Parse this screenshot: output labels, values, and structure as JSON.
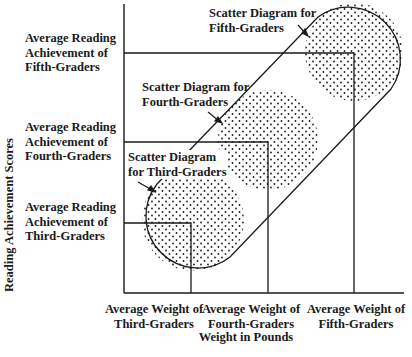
{
  "diagram": {
    "y_axis_title": "Reading Achievement Scores",
    "x_axis_title": "Weight in Pounds",
    "y_labels": [
      {
        "lines": [
          "Average Reading",
          "Achievement of",
          "Fifth-Graders"
        ]
      },
      {
        "lines": [
          "Average Reading",
          "Achievement of",
          "Fourth-Graders"
        ]
      },
      {
        "lines": [
          "Average Reading",
          "Achievement of",
          "Third-Graders"
        ]
      }
    ],
    "x_labels": [
      {
        "lines": [
          "Average Weight of",
          "Third-Graders"
        ]
      },
      {
        "lines": [
          "Average Weight of",
          "Fourth-Graders"
        ]
      },
      {
        "lines": [
          "Average Weight of",
          "Fifth-Graders"
        ]
      }
    ],
    "scatter_labels": [
      {
        "lines": [
          "Scatter Diagram",
          "for Third-Graders"
        ]
      },
      {
        "lines": [
          "Scatter Diagram for",
          "Fourth-Graders"
        ]
      },
      {
        "lines": [
          "Scatter Diagram for",
          "Fifth-Graders"
        ]
      }
    ],
    "colors": {
      "ink": "#1a1a1a",
      "background": "#ffffff"
    }
  }
}
